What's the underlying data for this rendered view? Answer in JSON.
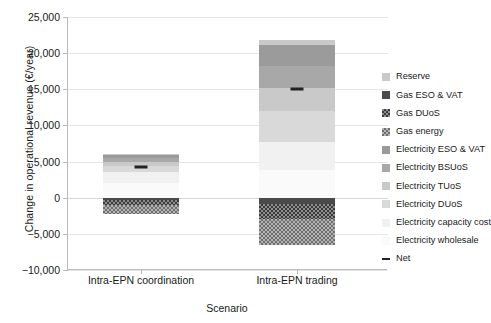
{
  "chart_data": {
    "type": "bar",
    "subtype": "stacked-waterfall",
    "title": "",
    "xlabel": "Scenario",
    "ylabel": "Change in operational revenue (€/year)",
    "categories": [
      "Intra-EPN coordination",
      "Intra-EPN trading"
    ],
    "ylim": [
      -10000,
      25000
    ],
    "yticks": [
      -10000,
      -5000,
      0,
      5000,
      10000,
      15000,
      20000,
      25000
    ],
    "ytick_labels": [
      "−10,000",
      "−5,000",
      "0",
      "5,000",
      "10,000",
      "15,000",
      "20,000",
      "25,000"
    ],
    "grid": true,
    "legend_position": "right",
    "series": [
      {
        "name": "Reserve",
        "values": [
          120,
          700
        ]
      },
      {
        "name": "Gas ESO & VAT",
        "values": [
          -250,
          -900
        ]
      },
      {
        "name": "Gas DUoS",
        "values": [
          -700,
          -2100
        ]
      },
      {
        "name": "Gas energy",
        "values": [
          -1250,
          -3600
        ]
      },
      {
        "name": "Electricity ESO & VAT",
        "values": [
          450,
          2900
        ]
      },
      {
        "name": "Electricity BSUoS",
        "values": [
          480,
          3000
        ]
      },
      {
        "name": "Electricity TUoS",
        "values": [
          520,
          3200
        ]
      },
      {
        "name": "Electricity DUoS",
        "values": [
          900,
          4300
        ]
      },
      {
        "name": "Electricity capacity cost",
        "values": [
          1500,
          3800
        ]
      },
      {
        "name": "Electricity wholesale",
        "values": [
          2030,
          3900
        ]
      }
    ],
    "net": {
      "name": "Net",
      "values": [
        4200,
        15000
      ]
    },
    "stack_totals": {
      "positive": [
        6000,
        21800
      ],
      "negative": [
        -2200,
        -6600
      ]
    }
  },
  "legend": {
    "items": [
      {
        "label": "Reserve",
        "swatch": "p-grey-lt"
      },
      {
        "label": "Gas ESO & VAT",
        "swatch": "p-dark"
      },
      {
        "label": "Gas DUoS",
        "swatch": "p-checker-dark"
      },
      {
        "label": "Gas energy",
        "swatch": "p-checker-mid"
      },
      {
        "label": "Electricity ESO & VAT",
        "swatch": "p-grey-dark"
      },
      {
        "label": "Electricity BSUoS",
        "swatch": "p-grey-mid"
      },
      {
        "label": "Electricity TUoS",
        "swatch": "p-grey-lt"
      },
      {
        "label": "Electricity DUoS",
        "swatch": "p-grey-lt2"
      },
      {
        "label": "Electricity capacity cost",
        "swatch": "p-vlight"
      },
      {
        "label": "Electricity wholesale",
        "swatch": "p-vvlight"
      },
      {
        "label": "Net",
        "swatch": "netline"
      }
    ]
  },
  "colors": {
    "axis": "#b9b9b9",
    "grid": "#e6e6e6",
    "net_marker": "#222222",
    "text": "#1a1a1a",
    "background": "#ffffff"
  }
}
